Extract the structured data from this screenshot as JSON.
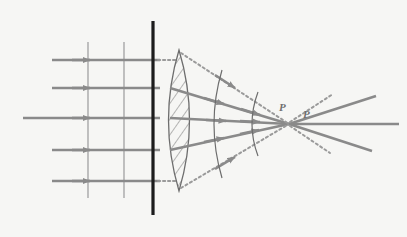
{
  "figure": {
    "background_color": "#f6f6f4",
    "ray_color": "#8a8a8a",
    "wavefront_color": "#9a9a9a",
    "lens_outline_color": "#6d6d6d",
    "lens_hatch_color": "#7d7d7d",
    "barrier_color": "#1c1c1c",
    "dotted_color": "#9a9a9a",
    "label_color": "#6f6f6f"
  },
  "labels": {
    "focus_near": "P",
    "focus_far": "P"
  },
  "optics": {
    "incoming_rays_count": 5,
    "incoming_ray_y": [
      60,
      88,
      118,
      150,
      181
    ],
    "incoming_ray_start_x": [
      52,
      52,
      23,
      52,
      52
    ],
    "incoming_ray_end_x": 160,
    "arrow_head_x": 88,
    "plane_wavefronts_x": [
      88,
      124
    ],
    "plane_wavefront_y_top": 42,
    "plane_wavefront_y_bottom": 198,
    "barrier_x": 153,
    "barrier_y_top": 21,
    "barrier_y_bottom": 215,
    "lens": {
      "center_x": 179,
      "top_y": 50,
      "bottom_y": 191,
      "half_width": 17,
      "hatch_lines": 17
    },
    "curved_wavefronts": [
      {
        "cx": 212,
        "ry": 54,
        "rx": 36,
        "label": "outer-arc"
      },
      {
        "cx": 250,
        "ry": 32,
        "rx": 26,
        "label": "inner-arc"
      }
    ],
    "focal_point_near": {
      "x": 289,
      "y": 124
    },
    "focal_point_far": {
      "x": 313,
      "y": 124
    },
    "refracted_rays": [
      {
        "from": [
          168,
          88
        ],
        "to": [
          289,
          124
        ]
      },
      {
        "from": [
          168,
          118
        ],
        "to": [
          289,
          124
        ]
      },
      {
        "from": [
          168,
          150
        ],
        "to": [
          289,
          124
        ]
      }
    ],
    "diverging_rays": [
      {
        "from": [
          313,
          124
        ],
        "to": [
          375,
          96
        ]
      },
      {
        "from": [
          313,
          124
        ],
        "to": [
          398,
          124
        ]
      },
      {
        "from": [
          313,
          124
        ],
        "to": [
          372,
          150
        ]
      }
    ],
    "dotted_construction_lines": [
      {
        "from": [
          160,
          60
        ],
        "to": [
          176,
          60
        ],
        "kind": "horizontal-top-stub"
      },
      {
        "from": [
          160,
          181
        ],
        "to": [
          176,
          181
        ],
        "kind": "horizontal-bottom-stub"
      },
      {
        "from": [
          183,
          52
        ],
        "to": [
          289,
          124
        ],
        "kind": "upper-marginal"
      },
      {
        "from": [
          183,
          189
        ],
        "to": [
          289,
          124
        ],
        "kind": "lower-marginal"
      },
      {
        "from": [
          289,
          124
        ],
        "to": [
          330,
          96
        ],
        "kind": "diverging-upper"
      },
      {
        "from": [
          289,
          124
        ],
        "to": [
          327,
          152
        ],
        "kind": "diverging-lower"
      }
    ]
  }
}
